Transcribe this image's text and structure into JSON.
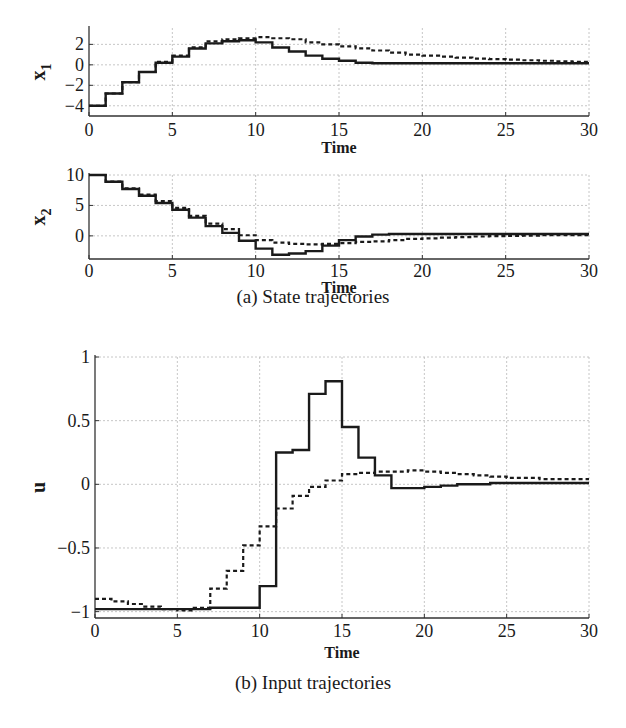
{
  "figure": {
    "caption_a": "(a) State trajectories",
    "caption_b": "(b) Input trajectories"
  },
  "colors": {
    "line": "#1a1a1a",
    "grid": "#b8b8b8",
    "axis": "#333333"
  },
  "chart_data": [
    {
      "id": "x1",
      "type": "line",
      "step": true,
      "title": "",
      "xlabel": "Time",
      "ylabel": "x1",
      "ylabel_main": "x",
      "ylabel_sub": "1",
      "xlim": [
        0,
        30
      ],
      "ylim": [
        -5,
        3.6
      ],
      "xticks": [
        0,
        5,
        10,
        15,
        20,
        25,
        30
      ],
      "yticks": [
        -4,
        -2,
        0,
        2
      ],
      "ytick_labels": [
        "−4",
        "−2",
        "0",
        "2"
      ],
      "grid": true,
      "x": [
        0,
        1,
        2,
        3,
        4,
        5,
        6,
        7,
        8,
        9,
        10,
        11,
        12,
        13,
        14,
        15,
        16,
        17,
        18,
        19,
        20,
        21,
        22,
        23,
        24,
        25,
        26,
        27,
        28,
        29,
        30
      ],
      "series": [
        {
          "name": "solid",
          "style": "solid",
          "values": [
            -4.0,
            -2.8,
            -1.7,
            -0.7,
            0.2,
            0.8,
            1.6,
            2.1,
            2.3,
            2.4,
            2.2,
            1.7,
            1.3,
            0.9,
            0.6,
            0.4,
            0.2,
            0.15,
            0.15,
            0.15,
            0.15,
            0.15,
            0.15,
            0.15,
            0.15,
            0.15,
            0.15,
            0.15,
            0.15,
            0.15,
            0.15
          ]
        },
        {
          "name": "dashed",
          "style": "dashed",
          "values": [
            -4.0,
            -2.8,
            -1.7,
            -0.7,
            0.3,
            0.9,
            1.7,
            2.3,
            2.5,
            2.6,
            2.7,
            2.6,
            2.5,
            2.2,
            2.0,
            1.8,
            1.6,
            1.4,
            1.2,
            1.0,
            0.9,
            0.8,
            0.7,
            0.6,
            0.55,
            0.5,
            0.45,
            0.4,
            0.35,
            0.3,
            0.3
          ]
        }
      ]
    },
    {
      "id": "x2",
      "type": "line",
      "step": true,
      "title": "",
      "xlabel": "Time",
      "ylabel": "x2",
      "ylabel_main": "x",
      "ylabel_sub": "2",
      "xlim": [
        0,
        30
      ],
      "ylim": [
        -3.8,
        10
      ],
      "xticks": [
        0,
        5,
        10,
        15,
        20,
        25,
        30
      ],
      "yticks": [
        0,
        5,
        10
      ],
      "ytick_labels": [
        "0",
        "5",
        "10"
      ],
      "grid": true,
      "x": [
        0,
        1,
        2,
        3,
        4,
        5,
        6,
        7,
        8,
        9,
        10,
        11,
        12,
        13,
        14,
        15,
        16,
        17,
        18,
        19,
        20,
        21,
        22,
        23,
        24,
        25,
        26,
        27,
        28,
        29,
        30
      ],
      "series": [
        {
          "name": "solid",
          "style": "solid",
          "values": [
            10.0,
            8.9,
            7.7,
            6.6,
            5.4,
            4.3,
            3.0,
            1.6,
            0.5,
            -0.8,
            -2.1,
            -3.1,
            -2.9,
            -2.5,
            -1.6,
            -0.7,
            -0.1,
            0.2,
            0.3,
            0.3,
            0.3,
            0.3,
            0.3,
            0.3,
            0.3,
            0.3,
            0.3,
            0.3,
            0.3,
            0.3,
            0.3
          ]
        },
        {
          "name": "dashed",
          "style": "dashed",
          "values": [
            10.0,
            8.9,
            7.8,
            6.8,
            5.7,
            4.6,
            3.3,
            2.0,
            1.1,
            0.1,
            -0.7,
            -1.1,
            -1.3,
            -1.4,
            -1.3,
            -1.2,
            -1.0,
            -0.9,
            -0.7,
            -0.5,
            -0.4,
            -0.3,
            -0.2,
            -0.1,
            -0.05,
            0.0,
            0.05,
            0.1,
            0.1,
            0.1,
            0.1
          ]
        }
      ]
    },
    {
      "id": "u",
      "type": "line",
      "step": true,
      "title": "",
      "xlabel": "Time",
      "ylabel": "u",
      "xlim": [
        0,
        30
      ],
      "ylim": [
        -1.05,
        1
      ],
      "xticks": [
        0,
        5,
        10,
        15,
        20,
        25,
        30
      ],
      "yticks": [
        -1,
        -0.5,
        0,
        0.5,
        1
      ],
      "ytick_labels": [
        "−1",
        "−0.5",
        "0",
        "0.5",
        "1"
      ],
      "grid": true,
      "x": [
        0,
        1,
        2,
        3,
        4,
        5,
        6,
        7,
        8,
        9,
        10,
        11,
        12,
        13,
        14,
        15,
        16,
        17,
        18,
        19,
        20,
        21,
        22,
        23,
        24,
        25,
        26,
        27,
        28,
        29,
        30
      ],
      "series": [
        {
          "name": "solid",
          "style": "solid",
          "values": [
            -0.98,
            -0.98,
            -0.98,
            -0.98,
            -0.98,
            -0.98,
            -0.98,
            -0.97,
            -0.97,
            -0.97,
            -0.8,
            0.25,
            0.27,
            0.71,
            0.81,
            0.45,
            0.21,
            0.07,
            -0.03,
            -0.03,
            -0.02,
            -0.01,
            0.0,
            0.0,
            0.01,
            0.01,
            0.01,
            0.01,
            0.01,
            0.01,
            0.01
          ]
        },
        {
          "name": "dashed",
          "style": "dashed",
          "values": [
            -0.9,
            -0.92,
            -0.94,
            -0.96,
            -0.98,
            -0.99,
            -0.97,
            -0.82,
            -0.68,
            -0.48,
            -0.33,
            -0.19,
            -0.09,
            -0.02,
            0.03,
            0.08,
            0.09,
            0.1,
            0.1,
            0.11,
            0.1,
            0.09,
            0.08,
            0.07,
            0.06,
            0.05,
            0.05,
            0.04,
            0.04,
            0.04,
            0.04
          ]
        }
      ]
    }
  ]
}
